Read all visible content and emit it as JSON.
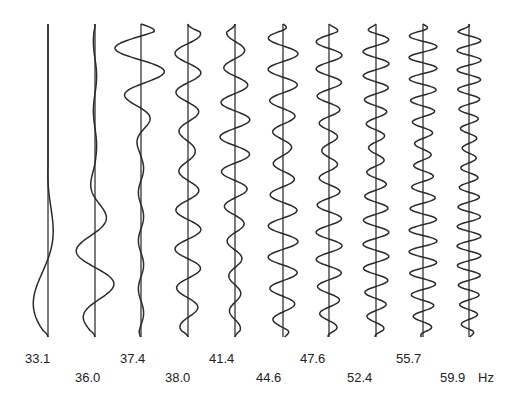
{
  "chart_data": {
    "type": "line",
    "title": "",
    "xlabel": "",
    "ylabel": "",
    "unit": "Hz",
    "orientation": "vertical-traces",
    "grid": false,
    "legend": null,
    "frequencies": [
      33.1,
      36.0,
      37.4,
      38.0,
      41.4,
      44.6,
      47.6,
      52.4,
      55.7,
      59.9
    ],
    "labels": [
      "33.1",
      "36.0",
      "37.4",
      "38.0",
      "41.4",
      "44.6",
      "47.6",
      "52.4",
      "55.7",
      "59.9"
    ],
    "unit_label": "Hz",
    "series": [
      {
        "name": "33.1",
        "x": 48,
        "cycles": 2.0,
        "amp": 20,
        "envelope": "bottom",
        "phase": 0.0
      },
      {
        "name": "36.0",
        "x": 95,
        "cycles": 4.5,
        "amp": 20,
        "envelope": "lower-mid",
        "phase": 0.5
      },
      {
        "name": "37.4",
        "x": 141,
        "cycles": 6.5,
        "amp": 26,
        "envelope": "top",
        "phase": 0.25
      },
      {
        "name": "38.0",
        "x": 188,
        "cycles": 8.0,
        "amp": 13,
        "envelope": "uniform",
        "phase": 0.0
      },
      {
        "name": "41.4",
        "x": 235,
        "cycles": 9.0,
        "amp": 15,
        "envelope": "upper-mid",
        "phase": 0.5
      },
      {
        "name": "44.6",
        "x": 283,
        "cycles": 10.0,
        "amp": 15,
        "envelope": "uniform",
        "phase": 0.3
      },
      {
        "name": "47.6",
        "x": 329,
        "cycles": 11.5,
        "amp": 13,
        "envelope": "uniform",
        "phase": 0.1
      },
      {
        "name": "52.4",
        "x": 376,
        "cycles": 13.0,
        "amp": 13,
        "envelope": "uniform",
        "phase": 0.6
      },
      {
        "name": "55.7",
        "x": 423,
        "cycles": 14.5,
        "amp": 14,
        "envelope": "uniform",
        "phase": 0.2
      },
      {
        "name": "59.9",
        "x": 469,
        "cycles": 16.0,
        "amp": 12,
        "envelope": "uniform",
        "phase": 0.4
      }
    ],
    "y_top": 24,
    "y_bottom": 337
  },
  "labels": {
    "row1": [
      {
        "text": "33.1",
        "x": 25,
        "y": 362
      },
      {
        "text": "37.4",
        "x": 120,
        "y": 362
      },
      {
        "text": "41.4",
        "x": 209,
        "y": 362
      },
      {
        "text": "47.6",
        "x": 300,
        "y": 362
      },
      {
        "text": "55.7",
        "x": 396,
        "y": 362
      }
    ],
    "row2": [
      {
        "text": "36.0",
        "x": 75,
        "y": 381
      },
      {
        "text": "38.0",
        "x": 165,
        "y": 381
      },
      {
        "text": "44.6",
        "x": 256,
        "y": 381
      },
      {
        "text": "52.4",
        "x": 347,
        "y": 381
      },
      {
        "text": "59.9",
        "x": 440,
        "y": 381
      }
    ],
    "unit": {
      "text": "Hz",
      "x": 478,
      "y": 381
    }
  }
}
